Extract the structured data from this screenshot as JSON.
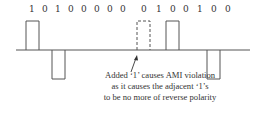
{
  "diagram": {
    "bits": [
      "1",
      "0",
      "1",
      "0",
      "0",
      "0",
      "0",
      "0",
      "0",
      "1",
      "0",
      "0",
      "1",
      "0",
      "0"
    ],
    "pulses": [
      {
        "bit_index": 0,
        "polarity": "positive",
        "style": "solid"
      },
      {
        "bit_index": 2,
        "polarity": "negative",
        "style": "solid"
      },
      {
        "bit_index": 8,
        "polarity": "positive",
        "style": "dashed",
        "note": "added 1"
      },
      {
        "bit_index": 9,
        "polarity": "positive",
        "style": "solid"
      },
      {
        "bit_index": 12,
        "polarity": "negative",
        "style": "solid"
      }
    ],
    "caption": {
      "line1": "Added ‘1’ causes AMI violation",
      "line2": "as it causes the adjacent ‘1’s",
      "line3": "to be no more of reverse polarity"
    },
    "colors": {
      "line": "#555555",
      "text": "#333333"
    }
  }
}
